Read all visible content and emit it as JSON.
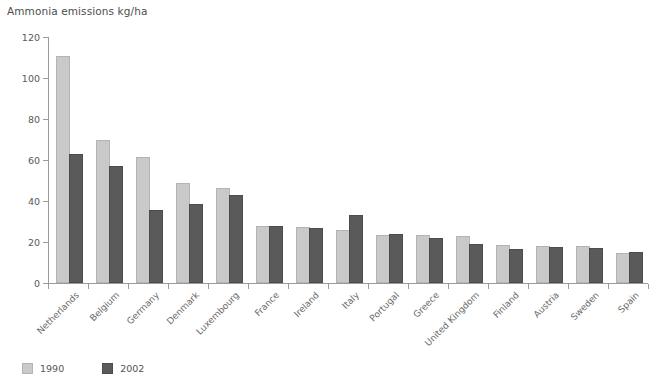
{
  "chart_data": {
    "type": "bar",
    "title": "Ammonia emissions kg/ha",
    "xlabel": "",
    "ylabel": "",
    "ylim": [
      0,
      120
    ],
    "yticks": [
      0,
      20,
      40,
      60,
      80,
      100,
      120
    ],
    "grid": false,
    "legend_position": "bottom-left",
    "categories": [
      "Netherlands",
      "Belgium",
      "Germany",
      "Denmark",
      "Luxembourg",
      "France",
      "Ireland",
      "Italy",
      "Portugal",
      "Greece",
      "United Kingdom",
      "Finland",
      "Austria",
      "Sweden",
      "Spain"
    ],
    "series": [
      {
        "name": "1990",
        "color": "#c9c9c9",
        "values": [
          110,
          69,
          60.5,
          48,
          45.5,
          27,
          26.5,
          25,
          22.5,
          22.5,
          22,
          17.5,
          17,
          17,
          13.5
        ]
      },
      {
        "name": "2002",
        "color": "#5a5a5a",
        "values": [
          62,
          56,
          34.5,
          37.5,
          42,
          27,
          26,
          32,
          23,
          21,
          18,
          15.5,
          16.5,
          16,
          14
        ]
      }
    ]
  }
}
